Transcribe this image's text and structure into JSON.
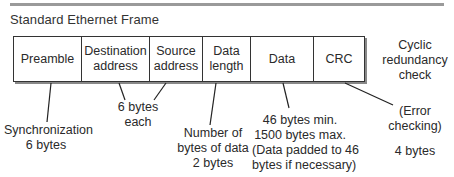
{
  "title": "Standard Ethernet Frame",
  "fields": [
    {
      "label_lines": [
        "Preamble"
      ]
    },
    {
      "label_lines": [
        "Destination",
        "address"
      ]
    },
    {
      "label_lines": [
        "Source",
        "address"
      ]
    },
    {
      "label_lines": [
        "Data",
        "length"
      ]
    },
    {
      "label_lines": [
        "Data"
      ]
    },
    {
      "label_lines": [
        "CRC"
      ]
    }
  ],
  "annotations": {
    "crc_name": [
      "Cyclic",
      "redundancy",
      "check"
    ],
    "preamble": [
      "Synchronization",
      "6 bytes"
    ],
    "addresses": [
      "6 bytes",
      "each"
    ],
    "data_length": [
      "Number of",
      "bytes of data",
      "2 bytes"
    ],
    "data": [
      "46 bytes min.",
      "1500 bytes max.",
      "(Data padded to 46",
      "bytes if necessary)"
    ],
    "crc_purpose": [
      "(Error",
      "checking)"
    ],
    "crc_size": "4 bytes"
  }
}
